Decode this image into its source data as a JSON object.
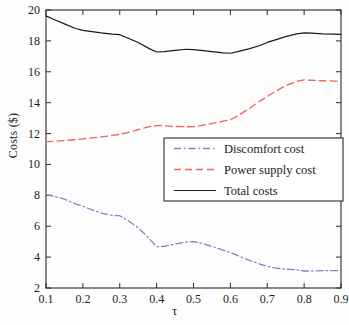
{
  "chart_data": {
    "type": "line",
    "title": "",
    "xlabel": "τ",
    "ylabel": "Costs ($)",
    "xlim": [
      0.1,
      0.9
    ],
    "ylim": [
      2,
      20
    ],
    "xticks": [
      "0.1",
      "0.2",
      "0.3",
      "0.4",
      "0.5",
      "0.6",
      "0.7",
      "0.8",
      "0.9"
    ],
    "yticks": [
      "2",
      "4",
      "6",
      "8",
      "10",
      "12",
      "14",
      "16",
      "18",
      "20"
    ],
    "grid": false,
    "legend_position": "center-right",
    "x": [
      0.1,
      0.12,
      0.15,
      0.18,
      0.2,
      0.22,
      0.25,
      0.28,
      0.3,
      0.32,
      0.35,
      0.38,
      0.4,
      0.42,
      0.45,
      0.48,
      0.5,
      0.52,
      0.55,
      0.58,
      0.6,
      0.62,
      0.65,
      0.68,
      0.7,
      0.72,
      0.75,
      0.78,
      0.8,
      0.82,
      0.85,
      0.88,
      0.9
    ],
    "series": [
      {
        "name": "Discomfort cost",
        "color": "#7b86c4",
        "style": "dash-dot",
        "values": [
          8.05,
          7.95,
          7.75,
          7.45,
          7.3,
          7.1,
          6.85,
          6.7,
          6.68,
          6.4,
          5.9,
          5.2,
          4.68,
          4.7,
          4.85,
          4.98,
          5.0,
          4.9,
          4.7,
          4.45,
          4.3,
          4.1,
          3.8,
          3.55,
          3.4,
          3.3,
          3.22,
          3.18,
          3.1,
          3.1,
          3.12,
          3.12,
          3.12
        ]
      },
      {
        "name": "Power supply cost",
        "color": "#f06060",
        "style": "dashed",
        "values": [
          11.48,
          11.5,
          11.55,
          11.6,
          11.65,
          11.7,
          11.78,
          11.88,
          11.95,
          12.05,
          12.25,
          12.45,
          12.52,
          12.5,
          12.46,
          12.44,
          12.45,
          12.52,
          12.65,
          12.8,
          12.9,
          13.15,
          13.6,
          14.1,
          14.4,
          14.7,
          15.1,
          15.38,
          15.48,
          15.45,
          15.42,
          15.4,
          15.38
        ]
      },
      {
        "name": "Total costs",
        "color": "#1a1a1a",
        "style": "solid",
        "values": [
          19.62,
          19.4,
          19.1,
          18.8,
          18.68,
          18.62,
          18.52,
          18.44,
          18.4,
          18.2,
          17.9,
          17.5,
          17.28,
          17.3,
          17.38,
          17.46,
          17.44,
          17.38,
          17.3,
          17.22,
          17.2,
          17.3,
          17.48,
          17.7,
          17.9,
          18.05,
          18.28,
          18.45,
          18.52,
          18.5,
          18.46,
          18.44,
          18.42
        ]
      }
    ]
  },
  "legend": {
    "items": [
      {
        "label": "Discomfort cost"
      },
      {
        "label": "Power supply cost"
      },
      {
        "label": "Total costs"
      }
    ]
  }
}
